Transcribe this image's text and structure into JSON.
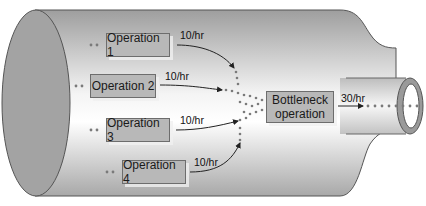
{
  "diagram": {
    "operations": [
      {
        "label": "Operation 1",
        "rate": "10/hr"
      },
      {
        "label": "Operation 2",
        "rate": "10/hr"
      },
      {
        "label": "Operation 3",
        "rate": "10/hr"
      },
      {
        "label": "Operation 4",
        "rate": "10/hr"
      }
    ],
    "bottleneck": {
      "line1": "Bottleneck",
      "line2": "operation"
    },
    "output_rate": "30/hr",
    "colors": {
      "bottle_body": "#d4d4d4",
      "bottle_base": "#a3a3a3",
      "box_fill": "#b8b8b8",
      "box_border": "#6d6d6d",
      "dots": "#7a7a7a",
      "arrow": "#222222"
    }
  }
}
